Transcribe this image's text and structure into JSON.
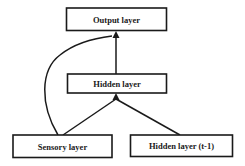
{
  "diagram": {
    "type": "neural-network-architecture",
    "nodes": [
      {
        "id": "output",
        "label": "Output layer"
      },
      {
        "id": "hidden",
        "label": "Hidden layer"
      },
      {
        "id": "sensory",
        "label": "Sensory layer"
      },
      {
        "id": "hidden_prev",
        "label": "Hidden layer (t-1)"
      }
    ],
    "edges": [
      {
        "from": "hidden",
        "to": "output",
        "style": "straight"
      },
      {
        "from": "sensory",
        "to": "output",
        "style": "curved"
      },
      {
        "from": "sensory",
        "to": "hidden",
        "style": "straight"
      },
      {
        "from": "hidden_prev",
        "to": "hidden",
        "style": "straight"
      }
    ]
  }
}
